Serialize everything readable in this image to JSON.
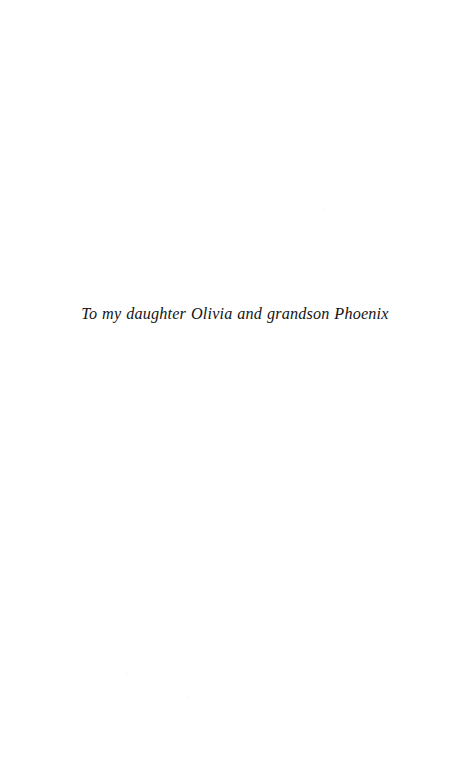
{
  "page": {
    "kind": "book-dedication-page",
    "background_color": "#ffffff",
    "width_px": 470,
    "height_px": 775
  },
  "dedication": {
    "text": "To my daughter Olivia and grandson Phoenix",
    "style": "italic-serif",
    "text_color": "#141414",
    "alignment": "center"
  }
}
